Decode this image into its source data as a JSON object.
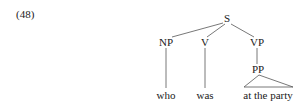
{
  "example_number": "(48)",
  "tree": {
    "root": "S",
    "nodes": {
      "S": "S",
      "NP": "NP",
      "V": "V",
      "VP": "VP",
      "PP": "PP"
    },
    "leaves": {
      "who": "who",
      "was": "was",
      "at_the_party": "at the party"
    }
  }
}
